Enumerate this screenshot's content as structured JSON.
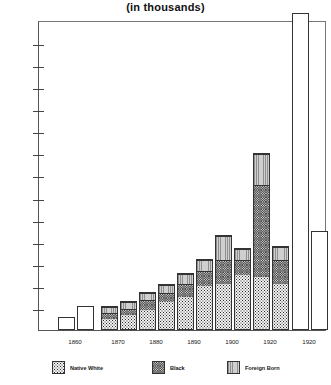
{
  "chart": {
    "title": "(in thousands)",
    "ylabel": "",
    "xlabel": ""
  },
  "axis": {
    "y_ticks": [
      10,
      20,
      30,
      40,
      50,
      60,
      70,
      80,
      90,
      100,
      110,
      120,
      130
    ],
    "y_tick_labels": [
      "10",
      "20",
      "30",
      "40",
      "50",
      "60",
      "70",
      "80",
      "90",
      "100",
      "110",
      "120",
      "130"
    ],
    "y_min": 0,
    "y_max": 138
  },
  "legend": {
    "items": [
      {
        "label": "Native White",
        "pattern": "nw",
        "color": "#f2f2f2"
      },
      {
        "label": "Black",
        "pattern": "bk",
        "color": "#d8d8d8"
      },
      {
        "label": "Foreign Born",
        "pattern": "fb",
        "color": "#b9b9b9"
      }
    ]
  },
  "chart_data": {
    "type": "bar",
    "title": "(in thousands)",
    "subtitle": "",
    "xlabel": "",
    "ylabel": "",
    "ylim": [
      0,
      138
    ],
    "yticks": [
      10,
      20,
      30,
      40,
      50,
      60,
      70,
      80,
      90,
      100,
      110,
      120,
      130
    ],
    "grid": false,
    "legend_position": "bottom",
    "stacked": true,
    "categories": [
      "1860",
      "1870",
      "1880",
      "1890",
      "1900",
      "1920",
      "1920"
    ],
    "series": [
      {
        "name": "Native White",
        "values": [
          [
            0,
            0
          ],
          [
            5,
            7
          ],
          [
            9,
            13
          ],
          [
            15,
            20
          ],
          [
            21,
            25
          ],
          [
            24,
            21
          ],
          [
            0,
            0
          ]
        ]
      },
      {
        "name": "Black",
        "values": [
          [
            0,
            0
          ],
          [
            3,
            3
          ],
          [
            5,
            4
          ],
          [
            6,
            7
          ],
          [
            11,
            7
          ],
          [
            42,
            11
          ],
          [
            0,
            0
          ]
        ]
      },
      {
        "name": "Foreign Born",
        "values": [
          [
            0,
            0
          ],
          [
            3,
            3
          ],
          [
            3,
            4
          ],
          [
            5,
            5
          ],
          [
            11,
            5
          ],
          [
            14,
            6
          ],
          [
            0,
            0
          ]
        ]
      }
    ],
    "bars": [
      {
        "group": "1860",
        "index": 0,
        "total": 6,
        "segments": [
          {
            "name": "Total",
            "value": 6,
            "pattern": "plain"
          }
        ]
      },
      {
        "group": "1860",
        "index": 1,
        "total": 11,
        "segments": [
          {
            "name": "Total",
            "value": 11,
            "pattern": "plain"
          }
        ]
      },
      {
        "group": "1870",
        "index": 0,
        "total": 11,
        "segments": [
          {
            "name": "Native White",
            "value": 5,
            "pattern": "nw"
          },
          {
            "name": "Black",
            "value": 3,
            "pattern": "bk"
          },
          {
            "name": "Foreign Born",
            "value": 3,
            "pattern": "fb"
          }
        ]
      },
      {
        "group": "1870",
        "index": 1,
        "total": 13,
        "segments": [
          {
            "name": "Native White",
            "value": 7,
            "pattern": "nw"
          },
          {
            "name": "Black",
            "value": 3,
            "pattern": "bk"
          },
          {
            "name": "Foreign Born",
            "value": 3,
            "pattern": "fb"
          }
        ]
      },
      {
        "group": "1880",
        "index": 0,
        "total": 17,
        "segments": [
          {
            "name": "Native White",
            "value": 9,
            "pattern": "nw"
          },
          {
            "name": "Black",
            "value": 5,
            "pattern": "bk"
          },
          {
            "name": "Foreign Born",
            "value": 3,
            "pattern": "fb"
          }
        ]
      },
      {
        "group": "1880",
        "index": 1,
        "total": 21,
        "segments": [
          {
            "name": "Native White",
            "value": 13,
            "pattern": "nw"
          },
          {
            "name": "Black",
            "value": 4,
            "pattern": "bk"
          },
          {
            "name": "Foreign Born",
            "value": 4,
            "pattern": "fb"
          }
        ]
      },
      {
        "group": "1890",
        "index": 0,
        "total": 26,
        "segments": [
          {
            "name": "Native White",
            "value": 15,
            "pattern": "nw"
          },
          {
            "name": "Black",
            "value": 6,
            "pattern": "bk"
          },
          {
            "name": "Foreign Born",
            "value": 5,
            "pattern": "fb"
          }
        ]
      },
      {
        "group": "1890",
        "index": 1,
        "total": 32,
        "segments": [
          {
            "name": "Native White",
            "value": 20,
            "pattern": "nw"
          },
          {
            "name": "Black",
            "value": 7,
            "pattern": "bk"
          },
          {
            "name": "Foreign Born",
            "value": 5,
            "pattern": "fb"
          }
        ]
      },
      {
        "group": "1900",
        "index": 0,
        "total": 43,
        "segments": [
          {
            "name": "Native White",
            "value": 21,
            "pattern": "nw"
          },
          {
            "name": "Black",
            "value": 11,
            "pattern": "bk"
          },
          {
            "name": "Foreign Born",
            "value": 11,
            "pattern": "fb"
          }
        ]
      },
      {
        "group": "1900",
        "index": 1,
        "total": 37,
        "segments": [
          {
            "name": "Native White",
            "value": 25,
            "pattern": "nw"
          },
          {
            "name": "Black",
            "value": 7,
            "pattern": "bk"
          },
          {
            "name": "Foreign Born",
            "value": 5,
            "pattern": "fb"
          }
        ]
      },
      {
        "group": "1920",
        "index": 0,
        "total": 80,
        "segments": [
          {
            "name": "Native White",
            "value": 24,
            "pattern": "nw"
          },
          {
            "name": "Black",
            "value": 42,
            "pattern": "bk"
          },
          {
            "name": "Foreign Born",
            "value": 14,
            "pattern": "fb"
          }
        ]
      },
      {
        "group": "1920",
        "index": 1,
        "total": 38,
        "segments": [
          {
            "name": "Native White",
            "value": 21,
            "pattern": "nw"
          },
          {
            "name": "Black",
            "value": 11,
            "pattern": "bk"
          },
          {
            "name": "Foreign Born",
            "value": 6,
            "pattern": "fb"
          }
        ]
      },
      {
        "group": "1920b",
        "index": 0,
        "total": 138,
        "segments": [
          {
            "name": "Total",
            "value": 138,
            "pattern": "plain"
          }
        ]
      },
      {
        "group": "1920b",
        "index": 1,
        "total": 45,
        "segments": [
          {
            "name": "Total",
            "value": 45,
            "pattern": "plain"
          }
        ]
      }
    ]
  },
  "groups": [
    {
      "label": "1860",
      "center": 75
    },
    {
      "label": "1870",
      "center": 118
    },
    {
      "label": "1880",
      "center": 156
    },
    {
      "label": "1890",
      "center": 194
    },
    {
      "label": "1900",
      "center": 232
    },
    {
      "label": "1920",
      "center": 270
    },
    {
      "label": "1920",
      "center": 309
    }
  ]
}
